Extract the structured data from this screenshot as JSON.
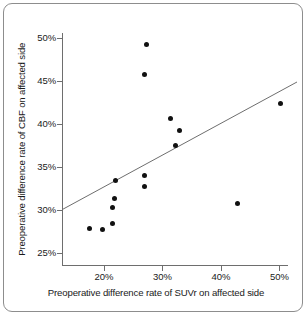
{
  "figure": {
    "border_color": "#8d8d8d",
    "background": "#ffffff"
  },
  "chart_data": {
    "type": "scatter",
    "title": "",
    "xlabel": "Preoperative difference rate of SUVr on affected side",
    "ylabel": "Preoperative difference rate of CBF on affected side",
    "x_tick_labels": [
      "20%",
      "30%",
      "40%",
      "50%"
    ],
    "x_ticks": [
      20,
      30,
      40,
      50
    ],
    "y_tick_labels": [
      "25%",
      "30%",
      "35%",
      "40%",
      "45%",
      "50%"
    ],
    "y_ticks": [
      25,
      30,
      35,
      40,
      45,
      50
    ],
    "xlim": [
      13,
      53
    ],
    "ylim": [
      23.6,
      50.6
    ],
    "grid": false,
    "legend": "none",
    "point_color": "#111111",
    "trendline_color": "#6e6e6e",
    "axis_color": "#6e6e6e",
    "points": [
      {
        "x": 17.5,
        "y": 27.9
      },
      {
        "x": 19.7,
        "y": 27.7
      },
      {
        "x": 21.5,
        "y": 28.4
      },
      {
        "x": 21.4,
        "y": 30.3
      },
      {
        "x": 21.8,
        "y": 31.3
      },
      {
        "x": 21.9,
        "y": 33.4
      },
      {
        "x": 26.9,
        "y": 32.7
      },
      {
        "x": 27.0,
        "y": 34.0
      },
      {
        "x": 26.9,
        "y": 45.8
      },
      {
        "x": 27.2,
        "y": 49.3
      },
      {
        "x": 31.3,
        "y": 40.6
      },
      {
        "x": 32.2,
        "y": 37.5
      },
      {
        "x": 32.9,
        "y": 39.3
      },
      {
        "x": 42.9,
        "y": 30.8
      },
      {
        "x": 50.1,
        "y": 42.4
      }
    ],
    "trendline": {
      "x_start": 13.0,
      "y_start": 30.1,
      "x_end": 53.0,
      "y_end": 44.9
    }
  }
}
